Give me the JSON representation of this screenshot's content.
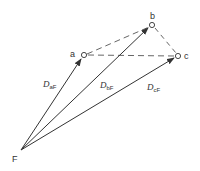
{
  "diagram": {
    "points": {
      "a": {
        "label": "a",
        "x": 84,
        "y": 55
      },
      "b": {
        "label": "b",
        "x": 152,
        "y": 25
      },
      "c": {
        "label": "c",
        "x": 178,
        "y": 56
      },
      "F": {
        "label": "F",
        "x": 21,
        "y": 150
      }
    },
    "vectors": [
      {
        "from": "F",
        "to": "a",
        "label_main": "D",
        "label_sub": "aF"
      },
      {
        "from": "F",
        "to": "b",
        "label_main": "D",
        "label_sub": "bF"
      },
      {
        "from": "F",
        "to": "c",
        "label_main": "D",
        "label_sub": "cF"
      }
    ],
    "dashed_edges": [
      [
        "a",
        "b"
      ],
      [
        "a",
        "c"
      ],
      [
        "b",
        "c"
      ]
    ],
    "colors": {
      "line": "#333333",
      "dashed": "#666666"
    }
  }
}
